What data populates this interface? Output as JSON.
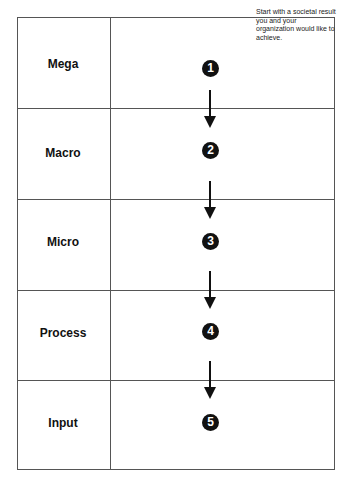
{
  "note": "Start with a societal result you and your organization would like to achieve.",
  "levels": [
    {
      "label": "Mega",
      "step": "1"
    },
    {
      "label": "Macro",
      "step": "2"
    },
    {
      "label": "Micro",
      "step": "3"
    },
    {
      "label": "Process",
      "step": "4"
    },
    {
      "label": "Input",
      "step": "5"
    }
  ]
}
